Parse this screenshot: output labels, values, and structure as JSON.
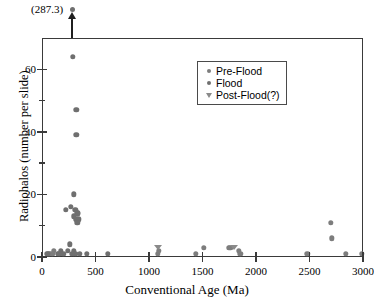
{
  "chart_data": {
    "type": "scatter",
    "title": "",
    "xlabel": "Conventional Age (Ma)",
    "ylabel": "Radiohalos (number per slide)",
    "xlim": [
      0,
      3000
    ],
    "ylim": [
      0,
      70
    ],
    "x_ticks": [
      0,
      500,
      1000,
      1500,
      2000,
      2500,
      3000
    ],
    "x_ticklabels": [
      "0",
      "500",
      "1000",
      "1500",
      "2000",
      "2500",
      "3000"
    ],
    "y_ticks": [
      0,
      20,
      40,
      60
    ],
    "y_ticklabels": [
      "0",
      "20",
      "40",
      "60"
    ],
    "y_minor_ticks": [
      10,
      30,
      50
    ],
    "grid": false,
    "legend_position": "upper-center",
    "legend": [
      {
        "label": "Pre-Flood",
        "marker": "circle",
        "color": "#7d7d7d"
      },
      {
        "label": "Flood",
        "marker": "circle",
        "color": "#6f6f6f"
      },
      {
        "label": "Post-Flood(?)",
        "marker": "triangle-down",
        "color": "#8a8a8a"
      }
    ],
    "annotations": [
      {
        "text": "(287.3)",
        "x": 287,
        "y": 72,
        "arrow": "up",
        "note": "off-scale point at 287.3 radiohalos per slide"
      }
    ],
    "series": [
      {
        "name": "Pre-Flood",
        "marker": "circle",
        "color": "#7d7d7d",
        "points": [
          {
            "x": 60,
            "y": 1
          },
          {
            "x": 75,
            "y": 1
          },
          {
            "x": 95,
            "y": 1
          },
          {
            "x": 110,
            "y": 2
          },
          {
            "x": 1080,
            "y": 1
          },
          {
            "x": 1090,
            "y": 2
          },
          {
            "x": 1440,
            "y": 1
          },
          {
            "x": 1510,
            "y": 3
          },
          {
            "x": 1745,
            "y": 3
          },
          {
            "x": 1760,
            "y": 3
          },
          {
            "x": 1840,
            "y": 2
          },
          {
            "x": 1855,
            "y": 1
          },
          {
            "x": 2480,
            "y": 1
          },
          {
            "x": 2700,
            "y": 11
          },
          {
            "x": 2710,
            "y": 6
          },
          {
            "x": 2840,
            "y": 1
          },
          {
            "x": 2990,
            "y": 1
          }
        ]
      },
      {
        "name": "Flood",
        "marker": "circle",
        "color": "#6f6f6f",
        "points": [
          {
            "x": 290,
            "y": 64
          },
          {
            "x": 320,
            "y": 47
          },
          {
            "x": 320,
            "y": 39
          },
          {
            "x": 300,
            "y": 20
          },
          {
            "x": 270,
            "y": 16
          },
          {
            "x": 310,
            "y": 15
          },
          {
            "x": 330,
            "y": 14
          },
          {
            "x": 335,
            "y": 14
          },
          {
            "x": 300,
            "y": 13
          },
          {
            "x": 320,
            "y": 12
          },
          {
            "x": 345,
            "y": 12
          },
          {
            "x": 330,
            "y": 11
          },
          {
            "x": 225,
            "y": 15
          },
          {
            "x": 260,
            "y": 4
          },
          {
            "x": 240,
            "y": 2
          },
          {
            "x": 280,
            "y": 1
          },
          {
            "x": 295,
            "y": 1
          },
          {
            "x": 300,
            "y": 2
          },
          {
            "x": 315,
            "y": 1
          },
          {
            "x": 355,
            "y": 1
          },
          {
            "x": 420,
            "y": 1
          },
          {
            "x": 145,
            "y": 1
          },
          {
            "x": 160,
            "y": 1
          },
          {
            "x": 175,
            "y": 2
          },
          {
            "x": 200,
            "y": 1
          },
          {
            "x": 50,
            "y": 1
          },
          {
            "x": 615,
            "y": 1
          }
        ]
      },
      {
        "name": "Post-Flood(?)",
        "marker": "triangle-down",
        "color": "#8a8a8a",
        "points": [
          {
            "x": 1085,
            "y": 3
          },
          {
            "x": 1790,
            "y": 3
          }
        ]
      }
    ]
  }
}
